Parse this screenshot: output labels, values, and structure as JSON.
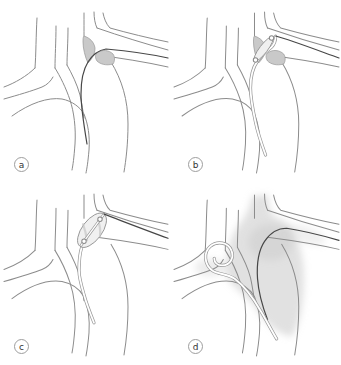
{
  "figure": {
    "panels": [
      {
        "id": "a",
        "label": "a"
      },
      {
        "id": "b",
        "label": "b"
      },
      {
        "id": "c",
        "label": "c"
      },
      {
        "id": "d",
        "label": "d"
      }
    ]
  },
  "colors": {
    "background": "#ffffff",
    "vessel-line": "#8c8c8c",
    "guidewire": "#474747",
    "shelf-fill": "#c9c9c9",
    "shelf-stroke": "#979797",
    "catheter-outline": "#979797",
    "catheter-fill": "#ffffff",
    "balloon-fill": "#f0f0f0",
    "contrast-fill": "#c4c4c4",
    "label-border": "#9e9e9e",
    "label-text": "#333333"
  }
}
